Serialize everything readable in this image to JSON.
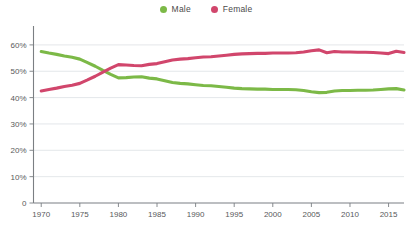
{
  "chart_data": {
    "type": "line",
    "title": "",
    "subtitle": "",
    "xlabel": "",
    "ylabel": "",
    "xlim": [
      1969,
      2017
    ],
    "ylim": [
      0,
      63
    ],
    "grid": true,
    "legend_position": "top-center",
    "y_ticks": [
      "0",
      "10%",
      "20%",
      "30%",
      "40%",
      "50%",
      "60%"
    ],
    "y_tick_values": [
      0,
      10,
      20,
      30,
      40,
      50,
      60
    ],
    "x_ticks": [
      "1970",
      "1975",
      "1980",
      "1985",
      "1990",
      "1995",
      "2000",
      "2005",
      "2010",
      "2015"
    ],
    "x_tick_values": [
      1970,
      1975,
      1980,
      1985,
      1990,
      1995,
      2000,
      2005,
      2010,
      2015
    ],
    "x": [
      1970,
      1971,
      1972,
      1973,
      1974,
      1975,
      1976,
      1977,
      1978,
      1979,
      1980,
      1981,
      1982,
      1983,
      1984,
      1985,
      1986,
      1987,
      1988,
      1989,
      1990,
      1991,
      1992,
      1993,
      1994,
      1995,
      1996,
      1997,
      1998,
      1999,
      2000,
      2001,
      2002,
      2003,
      2004,
      2005,
      2006,
      2007,
      2008,
      2009,
      2010,
      2011,
      2012,
      2013,
      2014,
      2015,
      2016,
      2017
    ],
    "series": [
      {
        "name": "Male",
        "color": "#7cb947",
        "values": [
          57.5,
          56.9,
          56.4,
          55.8,
          55.3,
          54.6,
          53.3,
          51.9,
          50.3,
          48.8,
          47.5,
          47.6,
          47.8,
          47.9,
          47.4,
          47.1,
          46.4,
          45.7,
          45.4,
          45.2,
          44.9,
          44.6,
          44.5,
          44.2,
          43.9,
          43.6,
          43.4,
          43.3,
          43.2,
          43.2,
          43.1,
          43.1,
          43.1,
          43.0,
          42.7,
          42.2,
          41.9,
          42.0,
          42.5,
          42.7,
          42.7,
          42.8,
          42.8,
          42.9,
          43.1,
          43.3,
          43.4,
          42.9
        ]
      },
      {
        "name": "Female",
        "color": "#d1466c",
        "values": [
          42.5,
          43.1,
          43.6,
          44.2,
          44.7,
          45.4,
          46.7,
          48.1,
          49.7,
          51.2,
          52.5,
          52.4,
          52.2,
          52.1,
          52.6,
          52.9,
          53.6,
          54.3,
          54.6,
          54.8,
          55.1,
          55.4,
          55.5,
          55.8,
          56.1,
          56.4,
          56.6,
          56.7,
          56.8,
          56.8,
          56.9,
          56.9,
          56.9,
          57.0,
          57.3,
          57.8,
          58.1,
          57.0,
          57.5,
          57.3,
          57.3,
          57.2,
          57.2,
          57.1,
          56.9,
          56.7,
          57.6,
          57.1
        ]
      }
    ],
    "legend": [
      {
        "label": "Male",
        "color": "#7cb947",
        "marker": "circle"
      },
      {
        "label": "Female",
        "color": "#d1466c",
        "marker": "circle"
      }
    ]
  },
  "colors": {
    "background": "#ffffff",
    "gridline": "#d9dde1",
    "axis": "#7b7f83",
    "tick_text": "#58595b",
    "male": "#7cb947",
    "female": "#d1466c"
  }
}
